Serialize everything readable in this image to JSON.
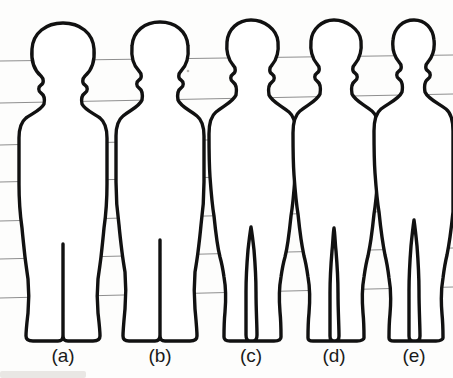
{
  "figure": {
    "background_color": "#fdfdfc",
    "outline_color": "#111111",
    "grid_color": "#8e8e8e",
    "baseline_y": 340,
    "labels": [
      {
        "id": "a",
        "text": "(a)",
        "x": 63,
        "y": 362
      },
      {
        "id": "b",
        "text": "(b)",
        "x": 160,
        "y": 362
      },
      {
        "id": "c",
        "text": "(c)",
        "x": 251,
        "y": 362
      },
      {
        "id": "d",
        "text": "(d)",
        "x": 334,
        "y": 362
      },
      {
        "id": "e",
        "text": "(e)",
        "x": 414,
        "y": 362
      }
    ],
    "grid_lines": [
      {
        "index": 1,
        "x1": 0,
        "y1": 61,
        "x2": 453,
        "y2": 55
      },
      {
        "index": 2,
        "x1": 0,
        "y1": 103,
        "x2": 453,
        "y2": 94
      },
      {
        "index": 3,
        "x1": 0,
        "y1": 145,
        "x2": 453,
        "y2": 134
      },
      {
        "index": 4,
        "x1": 0,
        "y1": 182,
        "x2": 453,
        "y2": 172
      },
      {
        "index": 5,
        "x1": 0,
        "y1": 221,
        "x2": 453,
        "y2": 210
      },
      {
        "index": 6,
        "x1": 0,
        "y1": 259,
        "x2": 453,
        "y2": 248
      },
      {
        "index": 7,
        "x1": 0,
        "y1": 298,
        "x2": 453,
        "y2": 287
      }
    ],
    "figures": [
      {
        "id": "a",
        "name": "infant-silhouette",
        "head_top_y": 23,
        "feet_y": 341,
        "center_x": 63,
        "path": "M 63 23 C 46 23 33 33 32 49 C 31 61 34 70 41 76 C 44 79 44 83 41 85 C 38 87 38 91 41 93 C 44 95 45 99 44 104 C 41 110 33 113 26 118 C 21 122 19 129 19 138 C 19 152 19 168 19 184 C 19 199 20 214 22 228 C 23 239 24 248 25 257 C 26 265 27 272 28 279 C 29 290 29 302 28 313 C 27 322 26 330 26 336 C 26 339 28 341 33 341 C 44 341 54 341 58 341 C 62 341 63 339 63 335 C 63 325 63 310 63 296 C 63 283 63 271 63 262 C 63 255 63 249 63 244 C 63 249 63 255 63 262 C 63 271 63 283 63 296 C 63 310 63 325 63 335 C 63 339 64 341 68 341 C 73 341 84 341 93 341 C 98 341 100 339 100 336 C 100 330 99 322 98 313 C 97 302 97 290 98 279 C 99 272 100 265 101 257 C 102 248 103 239 104 228 C 106 214 107 199 107 184 C 107 168 107 152 107 138 C 107 129 105 122 100 118 C 93 113 85 110 82 104 C 81 99 82 95 85 93 C 88 91 88 87 85 85 C 82 83 82 79 85 76 C 92 70 95 61 94 49 C 93 33 80 23 63 23 Z"
      },
      {
        "id": "b",
        "name": "young-child-silhouette",
        "head_top_y": 22,
        "feet_y": 341,
        "center_x": 160,
        "path": "M 160 22 C 145 22 133 31 132 46 C 131 57 133 65 139 71 C 142 74 142 78 139 80 C 136 82 136 86 139 88 C 142 90 143 94 142 100 C 139 107 130 110 123 116 C 118 120 116 127 116 136 C 116 150 116 166 116 182 C 116 197 117 211 119 225 C 120 236 121 244 122 252 C 123 260 124 266 125 272 C 126 284 126 297 125 309 C 124 320 123 330 123 336 C 123 339 125 341 129 341 C 139 341 150 341 155 341 C 158 341 160 339 160 335 C 160 325 160 310 160 295 C 160 282 160 269 160 260 C 160 252 160 245 160 240 C 160 245 160 252 160 260 C 160 269 160 282 160 295 C 160 310 160 325 160 335 C 160 339 161 341 165 341 C 170 341 181 341 190 341 C 195 341 197 339 197 336 C 197 330 196 320 195 309 C 194 297 194 284 195 272 C 196 266 197 260 198 252 C 199 244 200 236 201 225 C 203 211 204 197 204 182 C 204 166 204 150 204 136 C 204 127 202 120 197 116 C 190 110 181 107 178 100 C 177 94 178 90 181 88 C 184 86 184 82 181 80 C 178 78 178 74 181 71 C 187 65 189 57 188 46 C 187 31 175 22 160 22 Z"
      },
      {
        "id": "c",
        "name": "older-child-silhouette",
        "head_top_y": 20,
        "feet_y": 341,
        "center_x": 251,
        "path": "M 251 20 C 238 20 228 29 227 42 C 226 52 228 59 233 65 C 236 68 236 72 233 74 C 230 76 230 80 233 82 C 236 84 237 89 236 95 C 233 102 223 106 216 112 C 211 116 209 124 209 134 C 209 147 209 162 210 177 C 211 191 212 204 214 216 C 215 226 216 234 217 241 C 218 248 219 253 220 257 C 222 264 223 270 224 277 C 226 288 226 300 225 312 C 224 322 224 331 224 337 C 224 340 226 341 230 341 C 240 341 250 341 253 341 C 256 341 257 339 257 335 C 257 325 256 309 256 292 C 256 277 255 262 254 250 C 253 241 252 233 251 227 C 250 233 249 241 248 250 C 247 262 246 277 246 292 C 246 309 246 325 246 335 C 246 339 247 341 250 341 C 253 341 265 341 274 341 C 279 341 281 339 281 337 C 281 331 281 322 280 312 C 279 300 279 288 281 277 C 282 270 283 264 285 257 C 286 253 287 248 288 241 C 289 234 290 226 291 216 C 293 204 294 191 295 177 C 296 162 296 147 296 134 C 296 124 294 116 289 112 C 282 106 272 102 269 95 C 268 89 269 84 272 82 C 275 80 275 76 272 74 C 269 72 269 68 272 65 C 277 59 279 52 278 42 C 277 29 264 20 251 20 Z"
      },
      {
        "id": "d",
        "name": "adolescent-silhouette",
        "head_top_y": 20,
        "feet_y": 341,
        "center_x": 334,
        "path": "M 334 20 C 322 20 312 29 311 41 C 310 51 312 58 317 64 C 320 67 320 71 317 73 C 314 75 314 79 317 81 C 320 83 321 88 320 94 C 317 101 307 105 300 111 C 295 115 293 123 293 133 C 293 146 293 161 294 175 C 295 189 296 202 298 214 C 299 224 300 232 301 239 C 302 246 303 251 304 256 C 306 263 307 270 308 277 C 310 288 310 301 309 313 C 308 323 308 332 308 338 C 308 340 310 341 313 341 C 323 341 332 341 335 341 C 338 341 339 339 339 336 C 339 326 338 310 338 293 C 338 278 337 263 336 251 C 335 242 335 234 334 228 C 333 234 333 242 332 251 C 331 263 330 278 330 293 C 330 310 330 326 330 336 C 330 339 331 341 334 341 C 337 341 348 341 357 341 C 362 341 364 339 364 338 C 364 332 364 323 363 313 C 362 301 362 288 364 277 C 365 270 366 263 368 256 C 369 251 370 246 371 239 C 372 232 373 224 374 214 C 376 202 377 189 378 175 C 379 161 379 146 379 133 C 379 123 377 115 372 111 C 365 105 355 101 352 94 C 351 88 352 83 355 81 C 358 79 358 75 355 73 C 352 71 352 67 355 64 C 360 58 362 51 361 41 C 360 29 346 20 334 20 Z"
      },
      {
        "id": "e",
        "name": "adult-silhouette",
        "head_top_y": 20,
        "feet_y": 341,
        "center_x": 414,
        "path": "M 414 20 C 403 20 394 28 393 40 C 392 49 394 56 399 62 C 402 65 402 69 399 71 C 396 73 396 77 399 79 C 402 81 403 86 402 92 C 399 99 389 103 381 109 C 376 113 374 121 374 131 C 374 144 374 159 375 173 C 376 187 377 200 379 212 C 380 222 381 230 382 237 C 383 244 384 250 385 255 C 387 263 388 270 389 278 C 391 289 391 302 390 314 C 389 324 389 333 389 338 C 389 340 391 341 394 341 C 404 341 413 341 416 341 C 419 341 420 339 420 336 C 420 326 419 309 419 291 C 419 275 418 259 417 246 C 416 236 415 227 414 220 C 413 227 412 236 411 246 C 410 259 409 275 409 291 C 409 309 409 326 409 336 C 409 339 410 341 413 341 C 416 341 427 341 436 341 C 441 341 443 339 443 338 C 443 333 443 324 442 314 C 441 302 441 289 443 278 C 444 270 445 263 447 255 C 448 250 449 244 450 237 C 451 230 452 222 453 212 L 453 131 C 453 121 451 113 446 109 C 438 103 428 99 425 92 C 424 86 425 81 428 79 C 431 77 431 73 428 71 C 425 69 425 65 428 62 C 433 56 435 49 434 40 C 433 28 425 20 414 20 Z"
      }
    ]
  }
}
